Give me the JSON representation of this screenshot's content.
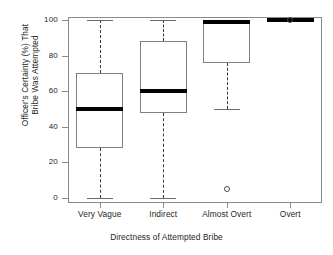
{
  "chart_data": {
    "type": "box",
    "title": "",
    "xlabel": "Directness of Attempted Bribe",
    "ylabel_line1": "Officer's Certainty (%) That",
    "ylabel_line2": "Bribe Was Attempted",
    "categories": [
      "Very Vague",
      "Indirect",
      "Almost Overt",
      "Overt"
    ],
    "ylim": [
      0,
      100
    ],
    "yticks": [
      0,
      20,
      40,
      60,
      80,
      100
    ],
    "ytick_labels": [
      "0",
      "20",
      "40",
      "60",
      "80",
      "100"
    ],
    "grid": false,
    "legend": "none",
    "boxes": [
      {
        "category": "Very Vague",
        "whisker_low": 0,
        "q1": 28,
        "median": 50,
        "q3": 70,
        "whisker_high": 100,
        "outliers": []
      },
      {
        "category": "Indirect",
        "whisker_low": 0,
        "q1": 48,
        "median": 60,
        "q3": 88,
        "whisker_high": 100,
        "outliers": []
      },
      {
        "category": "Almost Overt",
        "whisker_low": 50,
        "q1": 76,
        "median": 99,
        "q3": 100,
        "whisker_high": 100,
        "outliers": [
          5
        ]
      },
      {
        "category": "Overt",
        "whisker_low": 100,
        "q1": 100,
        "median": 100,
        "q3": 100,
        "whisker_high": 100,
        "outliers": [
          100
        ]
      }
    ]
  },
  "colors": {
    "axis": "#8a8a8a",
    "box_border": "#808080",
    "median": "#000000",
    "whisker": "#3a3a3a",
    "background": "#ffffff",
    "text": "#231f20"
  }
}
